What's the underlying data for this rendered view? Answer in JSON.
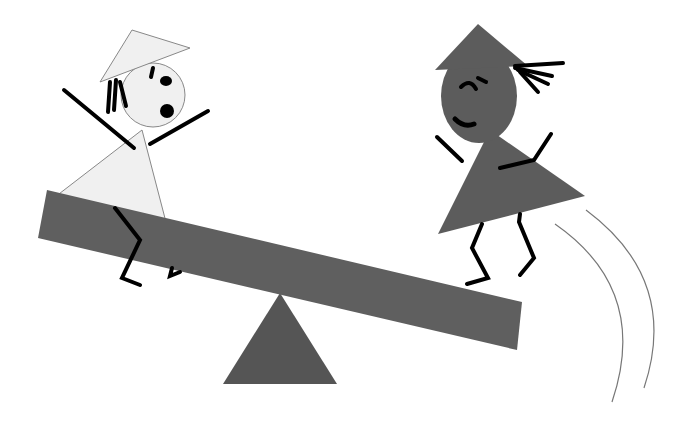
{
  "scene": {
    "description": "Two stick figures on a seesaw; the light figure on the left sits low, the dark figure on the right is launched into the air",
    "colors": {
      "background": "#ffffff",
      "seesaw": "#5f5f5f",
      "fulcrum": "#555555",
      "light_figure": "#f0f0f0",
      "dark_figure": "#5c5c5c",
      "lines": "#000000",
      "motion_lines": "#777777"
    }
  }
}
